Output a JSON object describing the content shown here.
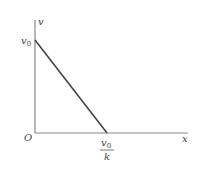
{
  "diagram": {
    "type": "line-graph",
    "axes": {
      "y_label": "v",
      "x_label": "x",
      "origin_label": "O"
    },
    "y_intercept_label": {
      "main": "v",
      "sub": "0"
    },
    "x_intercept_label": {
      "numerator_main": "v",
      "numerator_sub": "0",
      "denominator": "k"
    },
    "line": {
      "from": "(0, v0)",
      "to": "(v0/k, 0)",
      "color": "#444444"
    },
    "colors": {
      "axes": "#888888",
      "line": "#444444",
      "text": "#444444"
    }
  }
}
